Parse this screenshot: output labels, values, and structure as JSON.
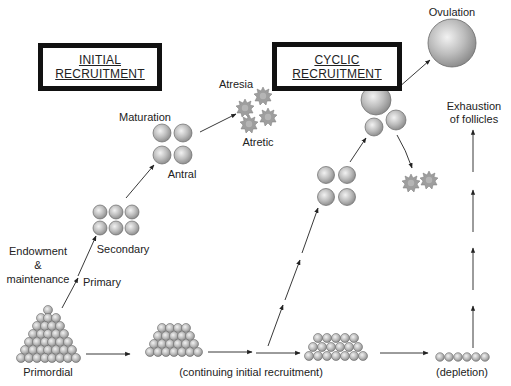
{
  "diagram": {
    "title_boxes": {
      "initial": {
        "line1": "INITIAL",
        "line2": "RECRUITMENT"
      },
      "cyclic": {
        "line1": "CYCLIC",
        "line2": "RECRUITMENT"
      }
    },
    "labels": {
      "ovulation": "Ovulation",
      "maturation": "Maturation",
      "antral": "Antral",
      "atresia": "Atresia",
      "atretic": "Atretic",
      "secondary": "Secondary",
      "endowment_1": "Endowment",
      "endowment_2": "&",
      "endowment_3": "maintenance",
      "primary": "Primary",
      "primordial": "Primordial",
      "continuing": "(continuing initial recruitment)",
      "depletion": "(depletion)",
      "exhaustion_1": "Exhaustion",
      "exhaustion_2": "of follicles"
    },
    "colors": {
      "follicle_fill": "#b8b8b8",
      "follicle_highlight": "#eeeeee",
      "follicle_stroke": "#6a6a6a",
      "atretic_fill": "#9a9a9a",
      "arrow": "#222222",
      "box_border": "#111111"
    },
    "stages": [
      "Primordial",
      "Primary",
      "Secondary",
      "Antral",
      "Maturation",
      "Ovulation",
      "Atresia"
    ]
  }
}
